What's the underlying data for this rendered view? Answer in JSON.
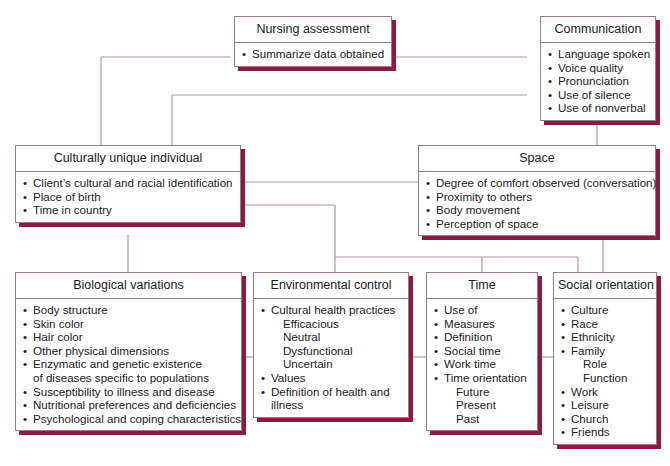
{
  "diagram": {
    "colors": {
      "shadow": "#8c1a44",
      "connector": "#b8919c",
      "border": "#9b7a85"
    },
    "nodes": {
      "nursing_assessment": {
        "title": "Nursing assessment",
        "items": [
          "Summarize data obtained"
        ]
      },
      "communication": {
        "title": "Communication",
        "items": [
          "Language spoken",
          "Voice quality",
          "Pronunciation",
          "Use of silence",
          "Use of nonverbal"
        ]
      },
      "culturally_unique_individual": {
        "title": "Culturally unique individual",
        "items": [
          "Client’s cultural and racial identification",
          "Place of birth",
          "Time in country"
        ]
      },
      "space": {
        "title": "Space",
        "items": [
          "Degree of comfort observed (conversation)",
          "Proximity to others",
          "Body movement",
          "Perception of space"
        ]
      },
      "biological_variations": {
        "title": "Biological variations",
        "items": [
          "Body structure",
          "Skin color",
          "Hair color",
          "Other physical dimensions",
          "Enzymatic and genetic existence",
          "of diseases specific to populations",
          "Susceptibility to illness and disease",
          "Nutritional preferences and deficiencies",
          "Psychological and coping characteristics"
        ]
      },
      "environmental_control": {
        "title": "Environmental control",
        "items": [
          "Cultural health practices",
          "Efficacious",
          "Neutral",
          "Dysfunctional",
          "Uncertain",
          "Values",
          "Definition of health and",
          "illness"
        ]
      },
      "time": {
        "title": "Time",
        "items": [
          "Use of",
          "Measures",
          "Definition",
          "Social time",
          "Work time",
          "Time orientation",
          "Future",
          "Present",
          "Past"
        ]
      },
      "social_orientation": {
        "title": "Social orientation",
        "items": [
          "Culture",
          "Race",
          "Ethnicity",
          "Family",
          "Role",
          "Function",
          "Work",
          "Leisure",
          "Church",
          "Friends"
        ]
      }
    },
    "bullet": "•"
  }
}
